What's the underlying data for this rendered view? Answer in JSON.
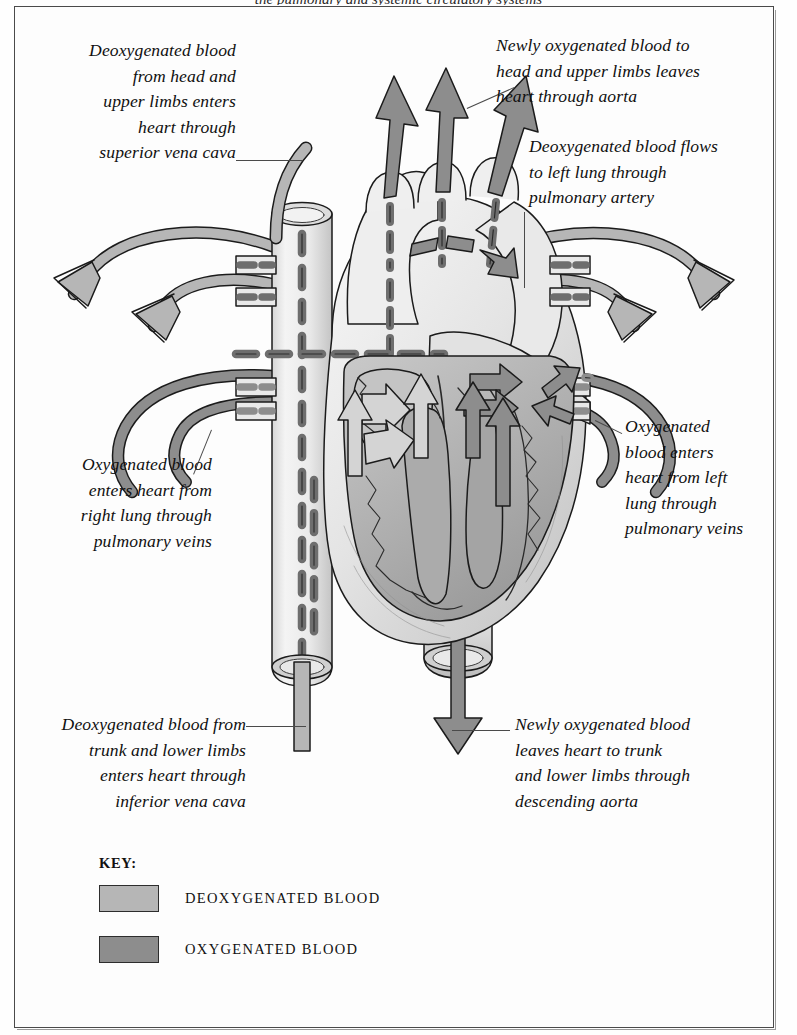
{
  "page": {
    "top_clipped_text": "the pulmonary and systemic circulatory systems",
    "frame_color": "#4a4a4a",
    "background": "#fdfdfd"
  },
  "annotations": [
    {
      "id": "superior-vena-cava",
      "align": "right",
      "text": "Deoxygenated blood\nfrom head and\nupper limbs enters\nheart through\nsuperior vena cava"
    },
    {
      "id": "aorta",
      "align": "left",
      "text": "Newly oxygenated blood to\nhead and upper limbs leaves\nheart through aorta"
    },
    {
      "id": "pulmonary-artery",
      "align": "left",
      "text": "Deoxygenated blood flows\nto left lung through\npulmonary artery"
    },
    {
      "id": "right-pulmonary-veins",
      "align": "right",
      "text": "Oxygenated blood\nenters heart from\nright lung through\npulmonary veins"
    },
    {
      "id": "left-pulmonary-veins",
      "align": "left",
      "text": "Oxygenated\nblood enters\nheart from left\nlung through\npulmonary veins"
    },
    {
      "id": "inferior-vena-cava",
      "align": "right",
      "text": "Deoxygenated blood from\ntrunk and lower limbs\nenters heart through\ninferior vena cava"
    },
    {
      "id": "descending-aorta",
      "align": "left",
      "text": "Newly oxygenated blood\nleaves heart to trunk\nand lower limbs through\ndescending aorta"
    }
  ],
  "key": {
    "title": "KEY:",
    "entries": [
      {
        "label": "DEOXYGENATED BLOOD",
        "color": "#b6b6b6"
      },
      {
        "label": "OXYGENATED BLOOD",
        "color": "#8d8d8d"
      }
    ]
  },
  "colors": {
    "deoxygenated": "#b6b6b6",
    "oxygenated": "#8d8d8d",
    "vessel_wall": "#efefef",
    "muscle_light": "#e6e6e6",
    "muscle_mid": "#bfbfbf",
    "muscle_dark": "#9d9d9d",
    "outline": "#1b1b1b",
    "leader": "#4a4a4a"
  },
  "diagram": {
    "flow_arrows": {
      "deoxygenated_light_outlined": 6,
      "oxygenated_dark_filled": 9
    },
    "labeled_vessels": [
      "superior vena cava",
      "inferior vena cava",
      "aorta",
      "descending aorta",
      "pulmonary artery",
      "pulmonary veins"
    ]
  }
}
